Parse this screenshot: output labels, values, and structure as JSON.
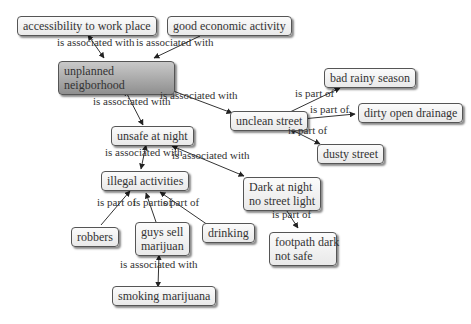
{
  "nodes": {
    "accessibility": "accessibility to work place",
    "economic": "good economic activity",
    "unplanned": [
      "unplanned",
      "neigborhood"
    ],
    "unclean": "unclean street",
    "rainy": "bad rainy season",
    "drainage": "dirty open drainage",
    "dusty": "dusty street",
    "unsafe": "unsafe at night",
    "illegal": "illegal activities",
    "dark": [
      "Dark at night",
      "no street light"
    ],
    "robbers": "robbers",
    "guys": [
      "guys sell",
      "marijuan"
    ],
    "drinking": "drinking",
    "footpath": [
      "footpath dark",
      "not safe"
    ],
    "smoking": "smoking marijuana"
  },
  "links": {
    "assoc": "is associated with",
    "part": "is part of"
  }
}
